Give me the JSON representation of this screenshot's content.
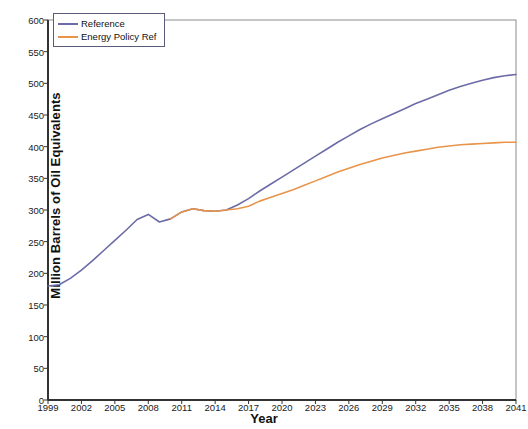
{
  "chart_data": {
    "type": "line",
    "title": "",
    "xlabel": "Year",
    "ylabel": "Million Barrels of Oil Equivalents",
    "xlim": [
      1999,
      2041
    ],
    "ylim": [
      0,
      600
    ],
    "grid": false,
    "legend_position": "top-left",
    "x_ticks": [
      "1999",
      "2002",
      "2005",
      "2008",
      "2011",
      "2014",
      "2017",
      "2020",
      "2023",
      "2026",
      "2029",
      "2032",
      "2035",
      "2038",
      "2041"
    ],
    "y_ticks": [
      "0",
      "50",
      "100",
      "150",
      "200",
      "250",
      "300",
      "350",
      "400",
      "450",
      "500",
      "550",
      "600"
    ],
    "x": [
      1999,
      2000,
      2001,
      2002,
      2003,
      2004,
      2005,
      2006,
      2007,
      2008,
      2009,
      2010,
      2011,
      2012,
      2013,
      2014,
      2015,
      2016,
      2017,
      2018,
      2019,
      2020,
      2021,
      2022,
      2023,
      2024,
      2025,
      2026,
      2027,
      2028,
      2029,
      2030,
      2031,
      2032,
      2033,
      2034,
      2035,
      2036,
      2037,
      2038,
      2039,
      2040,
      2041
    ],
    "series": [
      {
        "name": "Reference",
        "color": "#6C6CA6",
        "values": [
          180,
          182,
          192,
          205,
          220,
          236,
          252,
          268,
          285,
          293,
          281,
          286,
          297,
          302,
          299,
          298,
          300,
          308,
          318,
          330,
          341,
          352,
          363,
          374,
          385,
          396,
          407,
          417,
          427,
          436,
          444,
          452,
          460,
          468,
          475,
          482,
          489,
          495,
          500,
          505,
          509,
          512,
          514
        ]
      },
      {
        "name": "Energy Policy Ref",
        "color": "#E8954B",
        "values": [
          null,
          null,
          null,
          null,
          null,
          null,
          null,
          null,
          null,
          null,
          null,
          286,
          297,
          302,
          299,
          298,
          300,
          302,
          306,
          314,
          320,
          326,
          332,
          339,
          346,
          353,
          360,
          366,
          372,
          377,
          382,
          386,
          390,
          393,
          396,
          399,
          401,
          403,
          404,
          405,
          406,
          407,
          407
        ]
      }
    ],
    "annotations": []
  },
  "legend": {
    "items": [
      {
        "label": "Reference",
        "color": "#6C6CA6"
      },
      {
        "label": "Energy Policy Ref",
        "color": "#E8954B"
      }
    ]
  }
}
